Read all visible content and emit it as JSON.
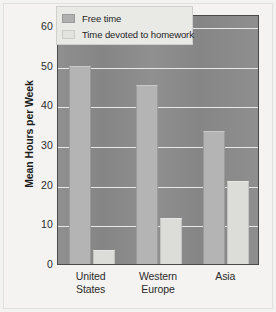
{
  "chart_data": {
    "type": "bar",
    "title": "",
    "subtitle": "",
    "xlabel": "",
    "ylabel": "Mean Hours per Week",
    "categories": [
      "United States",
      "Western Europe",
      "Asia"
    ],
    "category_lines": [
      [
        "United",
        "States"
      ],
      [
        "Western",
        "Europe"
      ],
      [
        "Asia"
      ]
    ],
    "series": [
      {
        "name": "Free time",
        "values": [
          50,
          45,
          33.5
        ],
        "color": "#b4b4b4"
      },
      {
        "name": "Time devoted to homework",
        "values": [
          3.6,
          11.5,
          21
        ],
        "color": "#dcdcd8"
      }
    ],
    "ylim": [
      0,
      63
    ],
    "yticks": [
      0,
      10,
      20,
      30,
      40,
      50,
      60
    ],
    "ytick_labels": [
      "0",
      "10",
      "20",
      "30",
      "40",
      "50",
      "60"
    ],
    "grid": true,
    "grid_axis": "y",
    "grid_color": "#efefef",
    "legend_position": "top-center",
    "plot_background": "#8a8a8a",
    "figure_background": "#f4f3f1"
  },
  "legend": {
    "items": [
      {
        "label": "Free time",
        "swatch": "free"
      },
      {
        "label": "Time devoted to homework",
        "swatch": "homework"
      }
    ]
  },
  "axis": {
    "y_title": "Mean Hours per Week"
  }
}
